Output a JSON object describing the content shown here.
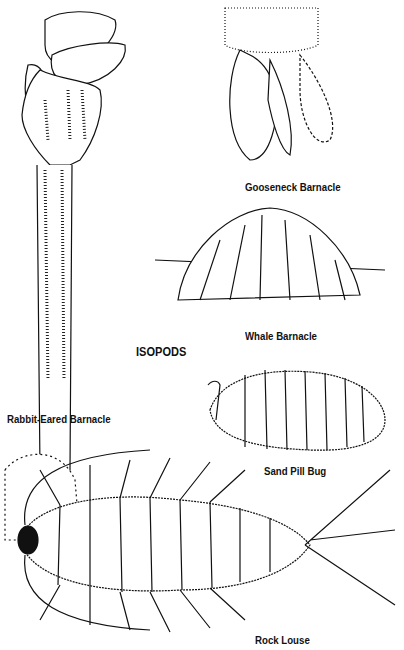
{
  "page": {
    "section_heading": "ISOPODS",
    "labels": {
      "gooseneck": "Gooseneck Barnacle",
      "whale": "Whale Barnacle",
      "rabbit": "Rabbit-Eared Barnacle",
      "sand_pill_bug": "Sand Pill Bug",
      "rock_louse": "Rock Louse"
    }
  }
}
